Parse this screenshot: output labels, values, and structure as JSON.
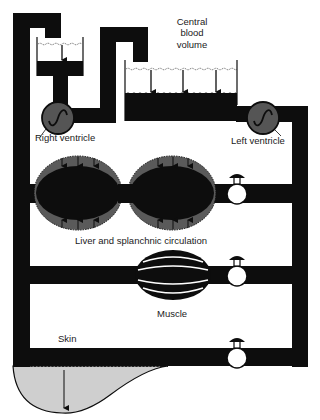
{
  "diagram": {
    "colors": {
      "vessel": "#0d0d0d",
      "ventricle": "#555555",
      "organ_outer": "#5a5a5a",
      "skin_pool": "#cfcfcf",
      "background": "#ffffff"
    },
    "labels": {
      "central_blood_volume_line1": "Central",
      "central_blood_volume_line2": "blood",
      "central_blood_volume_line3": "volume",
      "right_ventricle": "Right ventricle",
      "left_ventricle": "Left ventricle",
      "liver": "Liver and splanchnic circulation",
      "muscle": "Muscle",
      "skin": "Skin"
    },
    "components": [
      {
        "id": "right-atrial-reservoir",
        "type": "reservoir"
      },
      {
        "id": "central-reservoir",
        "type": "reservoir",
        "arrows": 3
      },
      {
        "id": "right-ventricle",
        "type": "pump"
      },
      {
        "id": "left-ventricle",
        "type": "pump"
      },
      {
        "id": "liver-splanchnic",
        "type": "compliant-vessels",
        "count": 2
      },
      {
        "id": "muscle",
        "type": "vessel-bundle"
      },
      {
        "id": "skin",
        "type": "pool"
      },
      {
        "id": "valve-liver",
        "type": "valve"
      },
      {
        "id": "valve-muscle",
        "type": "valve"
      },
      {
        "id": "valve-skin",
        "type": "valve"
      }
    ]
  }
}
